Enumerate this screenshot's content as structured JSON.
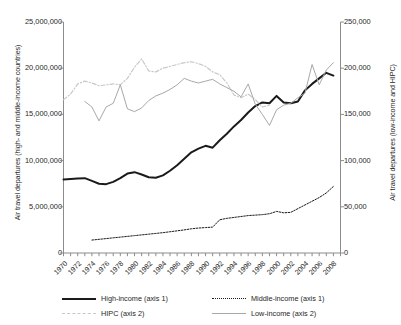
{
  "chart_data": {
    "type": "line",
    "title": "",
    "xlabel": "",
    "ylabel": "Air travel departures (high- and middle-income countries)",
    "y2label": "Air travel departures (low-income and HIPC)",
    "grid": false,
    "legend_position": "bottom",
    "xlim": [
      1970,
      2009
    ],
    "ylim": [
      0,
      25000000
    ],
    "y2lim": [
      0,
      250000
    ],
    "x_tick_step": 2,
    "x_minor_tick_step": 1,
    "x": [
      1970,
      1971,
      1972,
      1973,
      1974,
      1975,
      1976,
      1977,
      1978,
      1979,
      1980,
      1981,
      1982,
      1983,
      1984,
      1985,
      1986,
      1987,
      1988,
      1989,
      1990,
      1991,
      1992,
      1993,
      1994,
      1995,
      1996,
      1997,
      1998,
      1999,
      2000,
      2001,
      2002,
      2003,
      2004,
      2005,
      2006,
      2007,
      2008,
      2009
    ],
    "x_tick_labels": [
      "1970",
      "1972",
      "1974",
      "1976",
      "1978",
      "1980",
      "1982",
      "1984",
      "1986",
      "1988",
      "1990",
      "1992",
      "1994",
      "1996",
      "1998",
      "2000",
      "2002",
      "2004",
      "2006",
      "2008"
    ],
    "y_tick_labels": [
      "25,000,000",
      "20,000,000",
      "15,000,000",
      "10,000,000",
      "5,000,000",
      "0"
    ],
    "y_tick_values": [
      25000000,
      20000000,
      15000000,
      10000000,
      5000000,
      0
    ],
    "y2_tick_labels": [
      "250,000",
      "200,000",
      "150,000",
      "100,000",
      "50,000",
      "0"
    ],
    "y2_tick_values": [
      250000,
      200000,
      150000,
      100000,
      50000,
      0
    ],
    "series": [
      {
        "name": "High-income (axis 1)",
        "axis": "axis 1",
        "style": "solid-thick",
        "color": "#1a1a1a",
        "x": [
          1970,
          1971,
          1972,
          1973,
          1974,
          1975,
          1976,
          1977,
          1978,
          1979,
          1980,
          1981,
          1982,
          1983,
          1984,
          1985,
          1986,
          1987,
          1988,
          1989,
          1990,
          1991,
          1992,
          1993,
          1994,
          1995,
          1996,
          1997,
          1998,
          1999,
          2000,
          2001,
          2002,
          2003,
          2004,
          2005,
          2006,
          2007,
          2008
        ],
        "values": [
          7950000,
          8000000,
          8050000,
          8100000,
          7800000,
          7500000,
          7450000,
          7700000,
          8100000,
          8600000,
          8750000,
          8500000,
          8200000,
          8150000,
          8400000,
          8900000,
          9500000,
          10200000,
          10900000,
          11300000,
          11600000,
          11400000,
          12200000,
          12900000,
          13700000,
          14400000,
          15200000,
          15900000,
          16300000,
          16200000,
          17000000,
          16300000,
          16200000,
          16400000,
          17600000,
          18300000,
          18900000,
          19500000,
          19200000
        ]
      },
      {
        "name": "Middle-income (axis 1)",
        "axis": "axis 1",
        "style": "dotted",
        "color": "#1a1a1a",
        "x": [
          1974,
          1975,
          1976,
          1977,
          1978,
          1979,
          1980,
          1981,
          1982,
          1983,
          1984,
          1985,
          1986,
          1987,
          1988,
          1989,
          1990,
          1991,
          1992,
          1993,
          1994,
          1995,
          1996,
          1997,
          1998,
          1999,
          2000,
          2001,
          2002,
          2003,
          2004,
          2005,
          2006,
          2007,
          2008
        ],
        "values": [
          1400000,
          1480000,
          1560000,
          1640000,
          1720000,
          1800000,
          1880000,
          1960000,
          2040000,
          2120000,
          2200000,
          2300000,
          2400000,
          2500000,
          2620000,
          2700000,
          2750000,
          2800000,
          3600000,
          3750000,
          3850000,
          3950000,
          4050000,
          4100000,
          4150000,
          4250000,
          4500000,
          4350000,
          4400000,
          4800000,
          5200000,
          5600000,
          6000000,
          6500000,
          7200000
        ]
      },
      {
        "name": "HIPC (axis 2)",
        "axis": "axis 2",
        "style": "dashed-light",
        "color": "#c8c8c8",
        "x": [
          1970,
          1971,
          1972,
          1973,
          1974,
          1975,
          1976,
          1977,
          1978,
          1979,
          1980,
          1981,
          1982,
          1983,
          1984,
          1985,
          1986,
          1987,
          1988,
          1989,
          1990,
          1991,
          1992,
          1993,
          1994,
          1995,
          1996,
          1997,
          1998,
          1999
        ],
        "values": [
          166000,
          172000,
          183000,
          186000,
          184000,
          181000,
          182000,
          183000,
          182000,
          189000,
          201000,
          210000,
          197000,
          196000,
          200000,
          202000,
          204000,
          206000,
          207000,
          205000,
          202000,
          196000,
          193000,
          184000,
          171000,
          168000,
          172000,
          166000,
          158000,
          160000
        ]
      },
      {
        "name": "Low-income (axis 2)",
        "axis": "axis 2",
        "style": "solid-light",
        "color": "#a8a8a8",
        "x": [
          1973,
          1974,
          1975,
          1976,
          1977,
          1978,
          1979,
          1980,
          1981,
          1982,
          1983,
          1984,
          1985,
          1986,
          1987,
          1988,
          1989,
          1990,
          1991,
          1992,
          1993,
          1994,
          1995,
          1996,
          1997,
          1998,
          1999,
          2000,
          2001,
          2002,
          2003,
          2004,
          2005,
          2006,
          2007,
          2008
        ],
        "values": [
          164000,
          158000,
          143000,
          158000,
          162000,
          182000,
          156000,
          153000,
          157000,
          165000,
          170000,
          173000,
          177000,
          182000,
          189000,
          186000,
          184000,
          186000,
          188000,
          183000,
          179000,
          175000,
          169000,
          183000,
          161000,
          150000,
          138000,
          155000,
          160000,
          162000,
          168000,
          173000,
          204000,
          182000,
          198000,
          206000
        ]
      }
    ]
  },
  "legend": {
    "items": [
      {
        "label": "High-income (axis 1)",
        "color": "#1a1a1a",
        "style": "solid-thick"
      },
      {
        "label": "Middle-income (axis 1)",
        "color": "#1a1a1a",
        "style": "dotted"
      },
      {
        "label": "HIPC (axis 2)",
        "color": "#c8c8c8",
        "style": "dashed-light"
      },
      {
        "label": "Low-income (axis 2)",
        "color": "#a8a8a8",
        "style": "solid-light"
      }
    ]
  }
}
